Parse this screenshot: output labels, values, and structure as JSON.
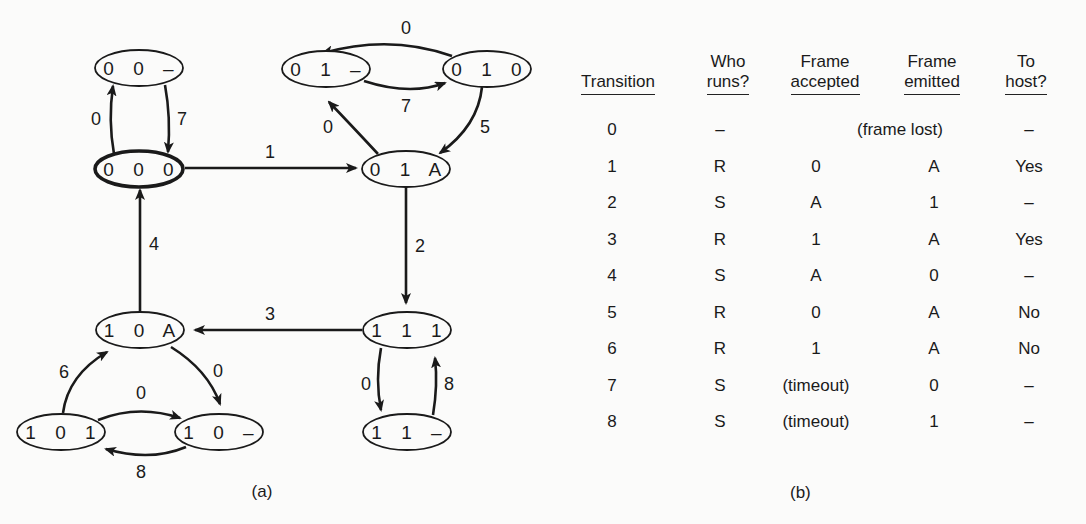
{
  "figure": {
    "part_a": {
      "caption": "(a)",
      "nodes": [
        {
          "id": "00-",
          "label": "0 0 –"
        },
        {
          "id": "000",
          "label": "0 0 0",
          "initial": true
        },
        {
          "id": "01-",
          "label": "0 1 –"
        },
        {
          "id": "010",
          "label": "0 1 0"
        },
        {
          "id": "01A",
          "label": "0 1 A"
        },
        {
          "id": "10A",
          "label": "1 0 A"
        },
        {
          "id": "111",
          "label": "1 1 1"
        },
        {
          "id": "101",
          "label": "1 0 1"
        },
        {
          "id": "10-",
          "label": "1 0 –"
        },
        {
          "id": "11-",
          "label": "1 1 –"
        }
      ],
      "edges": [
        {
          "from": "000",
          "to": "00-",
          "label": "0"
        },
        {
          "from": "00-",
          "to": "000",
          "label": "7"
        },
        {
          "from": "000",
          "to": "01A",
          "label": "1"
        },
        {
          "from": "010",
          "to": "01-",
          "label": "0"
        },
        {
          "from": "01-",
          "to": "010",
          "label": "7"
        },
        {
          "from": "01A",
          "to": "01-",
          "label": "0"
        },
        {
          "from": "010",
          "to": "01A",
          "label": "5"
        },
        {
          "from": "01A",
          "to": "111",
          "label": "2"
        },
        {
          "from": "111",
          "to": "10A",
          "label": "3"
        },
        {
          "from": "10A",
          "to": "000",
          "label": "4"
        },
        {
          "from": "111",
          "to": "11-",
          "label": "0"
        },
        {
          "from": "11-",
          "to": "111",
          "label": "8"
        },
        {
          "from": "101",
          "to": "10A",
          "label": "6"
        },
        {
          "from": "10A",
          "to": "10-",
          "label": "0"
        },
        {
          "from": "101",
          "to": "10-",
          "label": "0"
        },
        {
          "from": "10-",
          "to": "101",
          "label": "8"
        }
      ]
    },
    "part_b": {
      "caption": "(b)",
      "headers": [
        {
          "line1": "",
          "line2": "Transition"
        },
        {
          "line1": "Who",
          "line2": "runs?"
        },
        {
          "line1": "Frame",
          "line2": "accepted"
        },
        {
          "line1": "Frame",
          "line2": "emitted"
        },
        {
          "line1": "To",
          "line2": "host?"
        }
      ],
      "rows": [
        {
          "transition": "0",
          "who": "–",
          "accepted": "(frame lost)",
          "emitted": "",
          "to_host": "–"
        },
        {
          "transition": "1",
          "who": "R",
          "accepted": "0",
          "emitted": "A",
          "to_host": "Yes"
        },
        {
          "transition": "2",
          "who": "S",
          "accepted": "A",
          "emitted": "1",
          "to_host": "–"
        },
        {
          "transition": "3",
          "who": "R",
          "accepted": "1",
          "emitted": "A",
          "to_host": "Yes"
        },
        {
          "transition": "4",
          "who": "S",
          "accepted": "A",
          "emitted": "0",
          "to_host": "–"
        },
        {
          "transition": "5",
          "who": "R",
          "accepted": "0",
          "emitted": "A",
          "to_host": "No"
        },
        {
          "transition": "6",
          "who": "R",
          "accepted": "1",
          "emitted": "A",
          "to_host": "No"
        },
        {
          "transition": "7",
          "who": "S",
          "accepted": "(timeout)",
          "emitted": "0",
          "to_host": "–"
        },
        {
          "transition": "8",
          "who": "S",
          "accepted": "(timeout)",
          "emitted": "1",
          "to_host": "–"
        }
      ]
    }
  }
}
